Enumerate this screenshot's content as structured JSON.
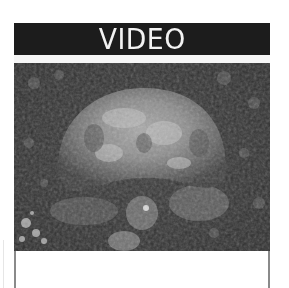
{
  "card": {
    "title": "VIDEO",
    "media": {
      "kind": "video-thumbnail",
      "subject": "tortoise",
      "palette": "grayscale"
    },
    "caption": ""
  },
  "colors": {
    "header_bg": "#1c1c1c",
    "header_text": "#f2f2f2",
    "border": "#8a8a8a"
  }
}
